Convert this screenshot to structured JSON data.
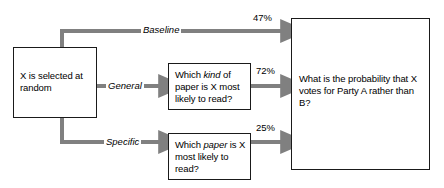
{
  "diagram": {
    "type": "flowchart",
    "orientation": "left-to-right",
    "nodes": {
      "source": {
        "id": "source",
        "text": "X is selected at random"
      },
      "general_question": {
        "id": "general_question",
        "text_parts": [
          "Which ",
          "kind",
          " of paper is X most likely to read?"
        ],
        "text": "Which kind of paper is X most likely to read?",
        "emphasis_word": "kind"
      },
      "specific_question": {
        "id": "specific_question",
        "text_parts": [
          "Which ",
          "paper",
          " is X most likely to read?"
        ],
        "text": "Which paper is X most likely to read?",
        "emphasis_word": "paper"
      },
      "outcome": {
        "id": "outcome",
        "text": "What is the probability that X votes for Party A rather than B?"
      }
    },
    "edges": [
      {
        "id": "baseline",
        "label": "Baseline",
        "value_label": "47%",
        "value": 47,
        "from": "source",
        "to": "outcome"
      },
      {
        "id": "general",
        "label": "General",
        "value_label": "72%",
        "value": 72,
        "from": "source",
        "via": "general_question",
        "to": "outcome"
      },
      {
        "id": "specific",
        "label": "Specific",
        "value_label": "25%",
        "value": 25,
        "from": "source",
        "via": "specific_question",
        "to": "outcome"
      }
    ],
    "colors": {
      "connector": "#808080",
      "box_border": "#1a1a1a",
      "text": "#000000",
      "background": "#ffffff"
    }
  }
}
